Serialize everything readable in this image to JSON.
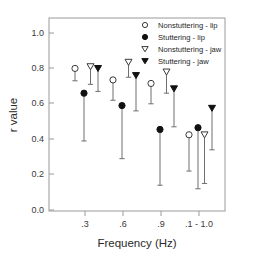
{
  "chart_data": {
    "type": "scatter",
    "title": "",
    "xlabel": "Frequency (Hz)",
    "ylabel": "r value",
    "categories": [
      ".3",
      ".6",
      ".9",
      ".1 - 1.0"
    ],
    "xtick_labels": [
      ".3",
      ".6",
      ".9",
      ".1 - 1.0"
    ],
    "ytick_labels": [
      "0.0",
      "0.2",
      "0.4",
      "0.6",
      "0.8",
      "1.0"
    ],
    "ytick_values": [
      0.0,
      0.2,
      0.4,
      0.6,
      0.8,
      1.0
    ],
    "ylim": [
      0.0,
      1.05
    ],
    "grid": false,
    "legend_position": "top-right",
    "error_bar_style": "lower-only",
    "series": [
      {
        "name": "Nonstuttering - lip",
        "marker": "open-circle",
        "values": [
          0.8,
          0.735,
          0.715,
          0.425
        ],
        "error_low": [
          0.73,
          0.62,
          0.6,
          0.22
        ]
      },
      {
        "name": "Stuttering - lip",
        "marker": "filled-circle",
        "values": [
          0.66,
          0.59,
          0.455,
          0.465
        ],
        "error_low": [
          0.39,
          0.29,
          0.14,
          0.12
        ]
      },
      {
        "name": "Nonstuttering - jaw",
        "marker": "open-triangle-down",
        "values": [
          0.81,
          0.835,
          0.78,
          0.425
        ],
        "error_low": [
          0.71,
          0.75,
          0.66,
          0.15
        ]
      },
      {
        "name": "Stuttering - jaw",
        "marker": "filled-triangle-down",
        "values": [
          0.8,
          0.76,
          0.685,
          0.575
        ],
        "error_low": [
          0.67,
          0.56,
          0.47,
          0.34
        ]
      }
    ],
    "colors": {
      "open_fill": "#ffffff",
      "marker_stroke": "#3a3a3a",
      "filled": "#111111",
      "error_bar": "#6e6e6e",
      "axis": "#9a9a9a"
    }
  },
  "legend": {
    "entries": [
      {
        "label": "Nonstuttering - lip"
      },
      {
        "label": "Stuttering - lip"
      },
      {
        "label": "Nonstuttering - jaw"
      },
      {
        "label": "Stuttering - jaw"
      }
    ]
  },
  "axes": {
    "y_title": "r value",
    "x_title": "Frequency (Hz)"
  }
}
